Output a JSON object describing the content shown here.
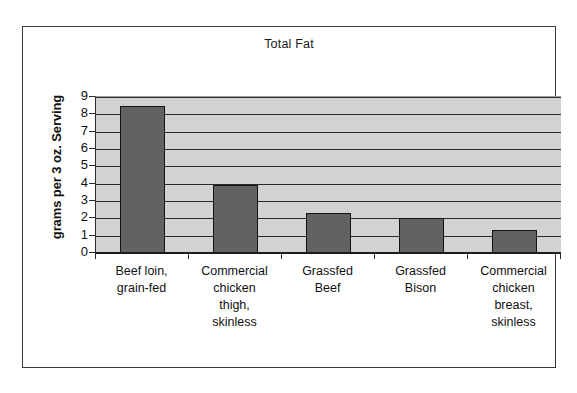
{
  "chart_data": {
    "type": "bar",
    "title": "Total Fat",
    "xlabel": "",
    "ylabel": "grams per 3 oz. Serving",
    "ylim": [
      0,
      9
    ],
    "ytick_step": 1,
    "yticks": [
      "9",
      "8",
      "7",
      "6",
      "5",
      "4",
      "3",
      "2",
      "1",
      "0"
    ],
    "grid": true,
    "legend": false,
    "legend_position": "none",
    "categories": [
      "Beef loin, grain-fed",
      "Commercial chicken thigh, skinless",
      "Grassfed Beef",
      "Grassfed Bison",
      "Commercial chicken breast, skinless"
    ],
    "category_lines": [
      [
        "Beef loin,",
        "grain-fed"
      ],
      [
        "Commercial",
        "chicken",
        "thigh,",
        "skinless"
      ],
      [
        "Grassfed",
        "Beef"
      ],
      [
        "Grassfed",
        "Bison"
      ],
      [
        "Commercial",
        "chicken",
        "breast,",
        "skinless"
      ]
    ],
    "values": [
      8.5,
      3.9,
      2.3,
      2.0,
      1.3
    ],
    "colors": {
      "bar_fill": "#626262",
      "bar_border": "#141414",
      "plot_background": "#d2d2d2",
      "gridline": "#2b2b2b",
      "frame_border": "#3a3a3a",
      "text": "#111111",
      "page_background": "#ffffff"
    }
  }
}
